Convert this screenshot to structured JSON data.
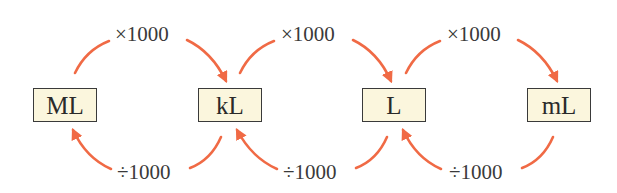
{
  "diagram": {
    "arrow_color": "#f06a45",
    "box_fill": "#fbf6dd",
    "units": [
      {
        "label": "ML"
      },
      {
        "label": "kL"
      },
      {
        "label": "L"
      },
      {
        "label": "mL"
      }
    ],
    "multiply_labels": [
      "×1000",
      "×1000",
      "×1000"
    ],
    "divide_labels": [
      "÷1000",
      "÷1000",
      "÷1000"
    ]
  }
}
